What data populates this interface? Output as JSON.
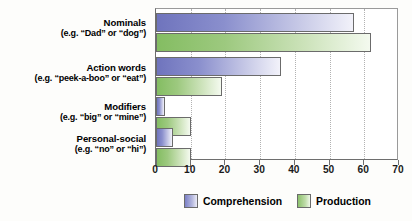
{
  "chart_data": {
    "type": "bar",
    "orientation": "horizontal",
    "title": "",
    "xlabel": "",
    "ylabel": "",
    "xlim": [
      0,
      70
    ],
    "xticks": [
      0,
      10,
      20,
      30,
      40,
      50,
      60,
      70
    ],
    "grid": "vertical-dotted",
    "legend_position": "bottom-center",
    "categories": [
      "Nominals",
      "Action words",
      "Modifiers",
      "Personal-social"
    ],
    "category_sublabels": [
      "(e.g. “Dad” or “dog”)",
      "(e.g. “peek-a-boo” or “eat”)",
      "(e.g. “big” or “mine”)",
      "(e.g. “no” or “hi”)"
    ],
    "series": [
      {
        "name": "Comprehension",
        "color": "#7b80c6",
        "values": [
          57,
          36,
          2.5,
          5
        ]
      },
      {
        "name": "Production",
        "color": "#8cc16c",
        "values": [
          62,
          19,
          10,
          10
        ]
      }
    ],
    "tick_labels": [
      "0",
      "10",
      "20",
      "30",
      "40",
      "50",
      "60",
      "70"
    ],
    "legend": [
      {
        "label": "Comprehension",
        "color": "#7b80c6"
      },
      {
        "label": "Production",
        "color": "#8cc16c"
      }
    ]
  },
  "axis": {
    "ticks": [
      {
        "value": 0,
        "label": "0"
      },
      {
        "value": 10,
        "label": "10"
      },
      {
        "value": 20,
        "label": "20"
      },
      {
        "value": 30,
        "label": "30"
      },
      {
        "value": 40,
        "label": "40"
      },
      {
        "value": 50,
        "label": "50"
      },
      {
        "value": 60,
        "label": "60"
      },
      {
        "value": 70,
        "label": "70"
      }
    ]
  }
}
